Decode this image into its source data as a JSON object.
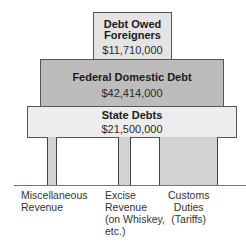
{
  "diagram": {
    "levels": [
      {
        "title_lines": [
          "Debt Owed",
          "Foreigners"
        ],
        "amount": "$11,710,000",
        "color": "#e4e4e4"
      },
      {
        "title_lines": [
          "Federal Domestic Debt"
        ],
        "amount": "$42,414,000",
        "color": "#bcbcbc"
      },
      {
        "title_lines": [
          "State Debts"
        ],
        "amount": "$21,500,000",
        "color": "#ededed"
      }
    ],
    "pillars": [
      {
        "label_lines": [
          "Miscellaneous",
          "Revenue"
        ]
      },
      {
        "label_lines": [
          "Excise",
          "Revenue",
          "(on Whiskey,",
          "etc.)"
        ]
      },
      {
        "label_lines": [
          "Customs",
          "Duties",
          "(Tariffs)"
        ]
      }
    ]
  }
}
